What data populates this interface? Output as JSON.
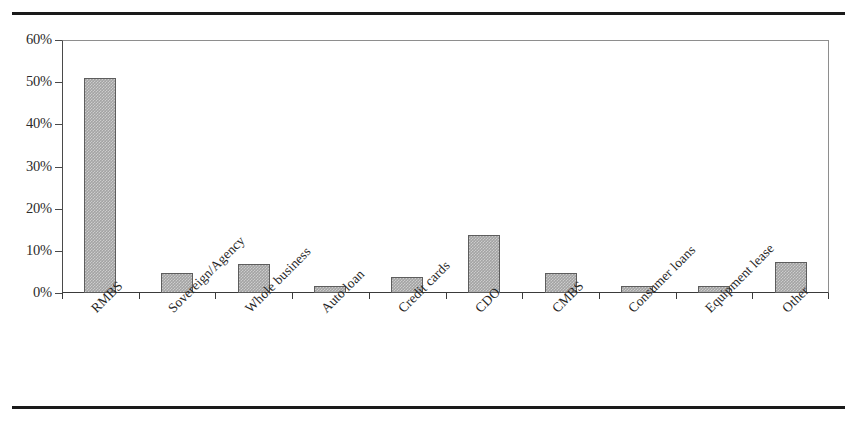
{
  "figure": {
    "accent_color": "#a3a3a3",
    "border_color": "#5d5d5d",
    "rule_color": "#1a1a1a"
  },
  "chart_data": {
    "type": "bar",
    "title": "",
    "xlabel": "",
    "ylabel": "",
    "ylim": [
      0,
      60
    ],
    "grid": false,
    "legend": "none",
    "yticks": [
      "0%",
      "10%",
      "20%",
      "30%",
      "40%",
      "50%",
      "60%"
    ],
    "ytick_values": [
      0,
      10,
      20,
      30,
      40,
      50,
      60
    ],
    "categories": [
      "RMBS",
      "Sovereign/Agency",
      "Whole business",
      "Auto loan",
      "Credit cards",
      "CDO",
      "CMBS",
      "Consumer loans",
      "Equipment lease",
      "Other"
    ],
    "values": [
      51.0,
      4.8,
      6.9,
      1.7,
      3.8,
      13.7,
      4.8,
      1.6,
      1.6,
      7.4
    ],
    "value_unit": "%"
  }
}
